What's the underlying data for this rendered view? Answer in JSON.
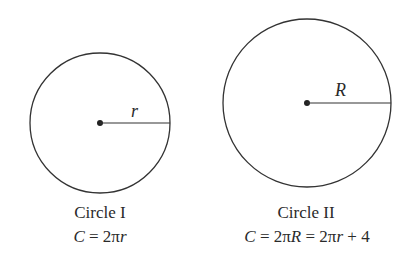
{
  "figure": {
    "circles": [
      {
        "name": "Circle I",
        "radius_label": "r",
        "formula": "C = 2πr",
        "formula_parts": {
          "lhs": "C",
          "eq": " = 2π",
          "var": "r"
        }
      },
      {
        "name": "Circle II",
        "radius_label": "R",
        "formula": "C = 2πR = 2πr + 4",
        "formula_parts": {
          "lhs": "C",
          "eq1": " = 2π",
          "var1": "R",
          "eq2": " = 2π",
          "var2": "r",
          "tail": " + 4"
        }
      }
    ]
  }
}
